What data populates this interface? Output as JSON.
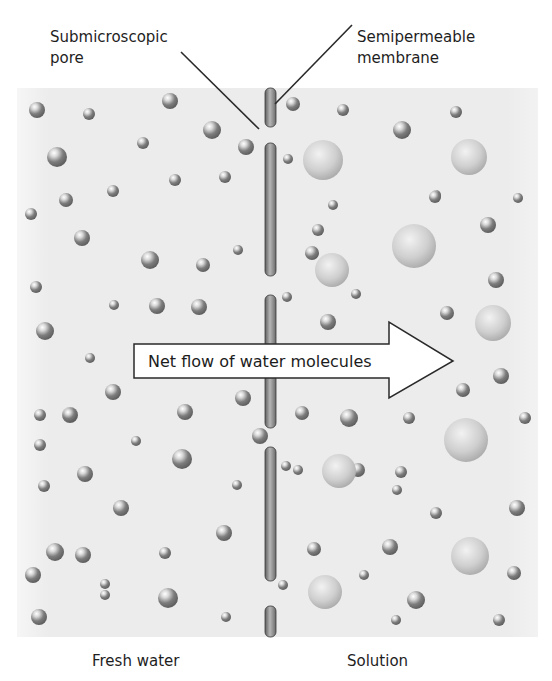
{
  "labels": {
    "pore": {
      "line1": "Submicroscopic",
      "line2": "pore"
    },
    "membrane": {
      "line1": "Semipermeable",
      "line2": "membrane"
    },
    "left_side": "Fresh water",
    "right_side": "Solution",
    "arrow": "Net flow of water molecules"
  },
  "colors": {
    "background": "#ececec",
    "membrane": "#8a8a8a",
    "water_molecule": "#7a7a7a",
    "solute_molecule": "#c9c9c9",
    "arrow_fill": "#ffffff",
    "arrow_stroke": "#2a2a2a"
  },
  "membrane_segments": [
    {
      "y1": 88,
      "y2": 127
    },
    {
      "y1": 143,
      "y2": 276
    },
    {
      "y1": 295,
      "y2": 428
    },
    {
      "y1": 447,
      "y2": 581
    },
    {
      "y1": 606,
      "y2": 637
    }
  ],
  "water_molecules_left": [
    [
      37,
      110,
      8
    ],
    [
      89,
      114,
      6
    ],
    [
      170,
      101,
      8
    ],
    [
      212,
      130,
      9
    ],
    [
      57,
      157,
      10
    ],
    [
      143,
      143,
      6
    ],
    [
      246,
      147,
      8
    ],
    [
      175,
      180,
      6
    ],
    [
      225,
      177,
      6
    ],
    [
      66,
      200,
      7
    ],
    [
      31,
      214,
      6
    ],
    [
      113,
      191,
      6
    ],
    [
      82,
      238,
      8
    ],
    [
      150,
      260,
      9
    ],
    [
      203,
      265,
      7
    ],
    [
      238,
      250,
      5
    ],
    [
      36,
      287,
      6
    ],
    [
      114,
      305,
      5
    ],
    [
      157,
      306,
      8
    ],
    [
      199,
      307,
      8
    ],
    [
      45,
      331,
      9
    ],
    [
      90,
      358,
      5
    ],
    [
      113,
      392,
      8
    ],
    [
      40,
      415,
      6
    ],
    [
      70,
      415,
      8
    ],
    [
      185,
      412,
      8
    ],
    [
      243,
      398,
      8
    ],
    [
      40,
      445,
      6
    ],
    [
      70,
      415,
      7
    ],
    [
      136,
      441,
      5
    ],
    [
      182,
      459,
      10
    ],
    [
      260,
      436,
      8
    ],
    [
      85,
      474,
      8
    ],
    [
      44,
      486,
      6
    ],
    [
      121,
      508,
      8
    ],
    [
      237,
      485,
      5
    ],
    [
      224,
      533,
      8
    ],
    [
      55,
      552,
      9
    ],
    [
      83,
      555,
      8
    ],
    [
      165,
      553,
      6
    ],
    [
      33,
      575,
      8
    ],
    [
      105,
      595,
      5
    ],
    [
      168,
      598,
      10
    ],
    [
      226,
      617,
      5
    ],
    [
      39,
      617,
      8
    ],
    [
      105,
      584,
      5
    ]
  ],
  "water_molecules_right": [
    [
      293,
      104,
      7
    ],
    [
      343,
      110,
      6
    ],
    [
      402,
      130,
      9
    ],
    [
      456,
      112,
      6
    ],
    [
      288,
      159,
      5
    ],
    [
      436,
      195,
      5
    ],
    [
      435,
      197,
      6
    ],
    [
      518,
      198,
      5
    ],
    [
      333,
      205,
      5
    ],
    [
      488,
      225,
      8
    ],
    [
      318,
      230,
      6
    ],
    [
      356,
      294,
      5
    ],
    [
      312,
      253,
      7
    ],
    [
      496,
      280,
      8
    ],
    [
      287,
      297,
      5
    ],
    [
      328,
      322,
      8
    ],
    [
      447,
      313,
      7
    ],
    [
      501,
      376,
      8
    ],
    [
      463,
      390,
      7
    ],
    [
      302,
      413,
      7
    ],
    [
      349,
      418,
      9
    ],
    [
      409,
      418,
      6
    ],
    [
      525,
      418,
      6
    ],
    [
      286,
      466,
      5
    ],
    [
      298,
      470,
      5
    ],
    [
      358,
      470,
      7
    ],
    [
      436,
      513,
      6
    ],
    [
      401,
      472,
      6
    ],
    [
      517,
      508,
      8
    ],
    [
      314,
      549,
      7
    ],
    [
      397,
      490,
      5
    ],
    [
      390,
      547,
      8
    ],
    [
      514,
      573,
      7
    ],
    [
      364,
      575,
      5
    ],
    [
      416,
      600,
      9
    ],
    [
      396,
      620,
      5
    ],
    [
      499,
      620,
      6
    ],
    [
      283,
      585,
      5
    ]
  ],
  "solute_molecules_right": [
    [
      323,
      160,
      20
    ],
    [
      469,
      157,
      18
    ],
    [
      414,
      246,
      22
    ],
    [
      332,
      270,
      17
    ],
    [
      493,
      323,
      18
    ],
    [
      466,
      440,
      22
    ],
    [
      339,
      471,
      17
    ],
    [
      470,
      556,
      19
    ],
    [
      325,
      592,
      17
    ],
    [
      531,
      160,
      0
    ]
  ]
}
